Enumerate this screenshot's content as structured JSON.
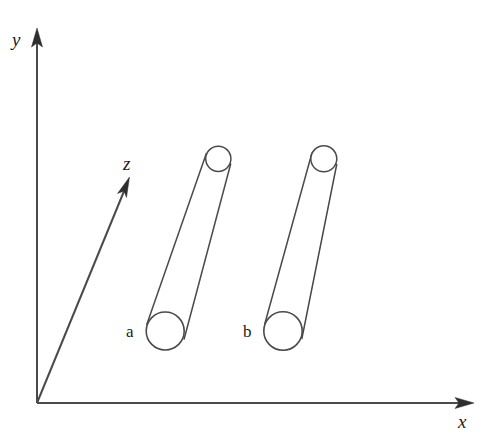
{
  "figure": {
    "title": "",
    "background_color": "#ffffff",
    "line_color": "#4a4a4a",
    "text_color": "#1c1c1c",
    "width": 492,
    "height": 439
  },
  "axes": {
    "origin": {
      "x": 37,
      "y": 403
    },
    "items": [
      {
        "id": "y",
        "label": "y",
        "icon": "arrow-up-icon",
        "direction": "up",
        "from": {
          "x": 37,
          "y": 403
        },
        "to": {
          "x": 37,
          "y": 30
        },
        "label_pos": {
          "x": 12,
          "y": 45
        }
      },
      {
        "id": "x",
        "label": "x",
        "icon": "arrow-right-icon",
        "direction": "right",
        "from": {
          "x": 37,
          "y": 403
        },
        "to": {
          "x": 472,
          "y": 403
        },
        "label_pos": {
          "x": 458,
          "y": 427
        }
      },
      {
        "id": "z",
        "label": "z",
        "icon": "arrow-diagonal-icon",
        "direction": "up-right-diagonal",
        "from": {
          "x": 37,
          "y": 403
        },
        "to": {
          "x": 130,
          "y": 177
        },
        "label_pos": {
          "x": 122,
          "y": 170
        }
      }
    ]
  },
  "objects": [
    {
      "id": "cylinder-a",
      "label": "a",
      "shape": "tapered-cylinder",
      "label_pos": {
        "x": 126,
        "y": 336
      },
      "bottom_cap": {
        "cx": 165,
        "cy": 331,
        "r": 19
      },
      "top_cap": {
        "cx": 218,
        "cy": 159,
        "rx": 12.5,
        "ry": 13
      },
      "body_path": "M 146.6 325.5 L 206.2 155.4 M 183.8 340.0 L 230.6 163.6"
    },
    {
      "id": "cylinder-b",
      "label": "b",
      "shape": "tapered-cylinder",
      "label_pos": {
        "x": 243,
        "y": 336
      },
      "bottom_cap": {
        "cx": 283,
        "cy": 331,
        "r": 19
      },
      "top_cap": {
        "cx": 324,
        "cy": 159,
        "rx": 13,
        "ry": 13
      },
      "body_path": "M 264.5 325.0 L 311.8 155.0 M 301.6 339.5 L 336.6 164.0"
    }
  ],
  "labels": {
    "axis_y": "y",
    "axis_x": "x",
    "axis_z": "z",
    "object_a": "a",
    "object_b": "b"
  }
}
